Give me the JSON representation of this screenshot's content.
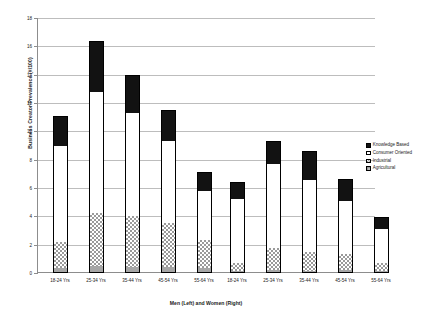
{
  "chart_data": {
    "type": "bar",
    "stacked": true,
    "title": "",
    "xlabel": "Men (Left) and Women (Right)",
    "ylabel": "Business Creator Prevalence (#/100)",
    "ylim": [
      0,
      18
    ],
    "ytick_step": 2,
    "ytick_labels": [
      "0",
      "2",
      "4",
      "6",
      "8",
      "10",
      "12",
      "14",
      "16",
      "18"
    ],
    "grid": true,
    "legend_position": "right",
    "groups": [
      "Men (Left)",
      "Women (Right)"
    ],
    "categories": [
      "18-24 Yrs",
      "25-34 Yrs",
      "35-44 Yrs",
      "45-54 Yrs",
      "55-64 Yrs"
    ],
    "series": [
      {
        "name": "Agricultural",
        "color": "#a6a6a6",
        "pattern": "solid-gray",
        "men": [
          0.35,
          0.5,
          0.4,
          0.4,
          0.35
        ],
        "women": [
          0.15,
          0.2,
          0.15,
          0.2,
          0.15
        ]
      },
      {
        "name": "Industrial",
        "color": "#ffffff",
        "pattern": "checkerboard",
        "men": [
          1.85,
          3.75,
          3.6,
          3.15,
          1.95
        ],
        "women": [
          0.55,
          1.55,
          1.35,
          1.15,
          0.55
        ]
      },
      {
        "name": "Consumer Oriented",
        "color": "#ffffff",
        "pattern": "plain-white",
        "men": [
          6.8,
          8.55,
          7.3,
          5.8,
          3.5
        ],
        "women": [
          4.5,
          5.95,
          5.1,
          3.75,
          2.4
        ]
      },
      {
        "name": "Knowledge Based",
        "color": "#121212",
        "pattern": "solid-black",
        "men": [
          2.1,
          3.6,
          2.7,
          2.15,
          1.3
        ],
        "women": [
          1.2,
          1.6,
          2.0,
          1.55,
          0.85
        ]
      }
    ],
    "totals": {
      "men": [
        11.1,
        16.4,
        14.0,
        11.5,
        7.1
      ],
      "women": [
        6.4,
        9.3,
        8.6,
        6.65,
        3.95
      ]
    }
  },
  "legend": {
    "items": [
      {
        "label": "Knowledge Based",
        "swatch": "sw-knowledge"
      },
      {
        "label": "Consumer Oriented",
        "swatch": "sw-consumer"
      },
      {
        "label": "Industrial",
        "swatch": "sw-industrial"
      },
      {
        "label": "Agricultural",
        "swatch": "sw-agricultural"
      }
    ]
  }
}
